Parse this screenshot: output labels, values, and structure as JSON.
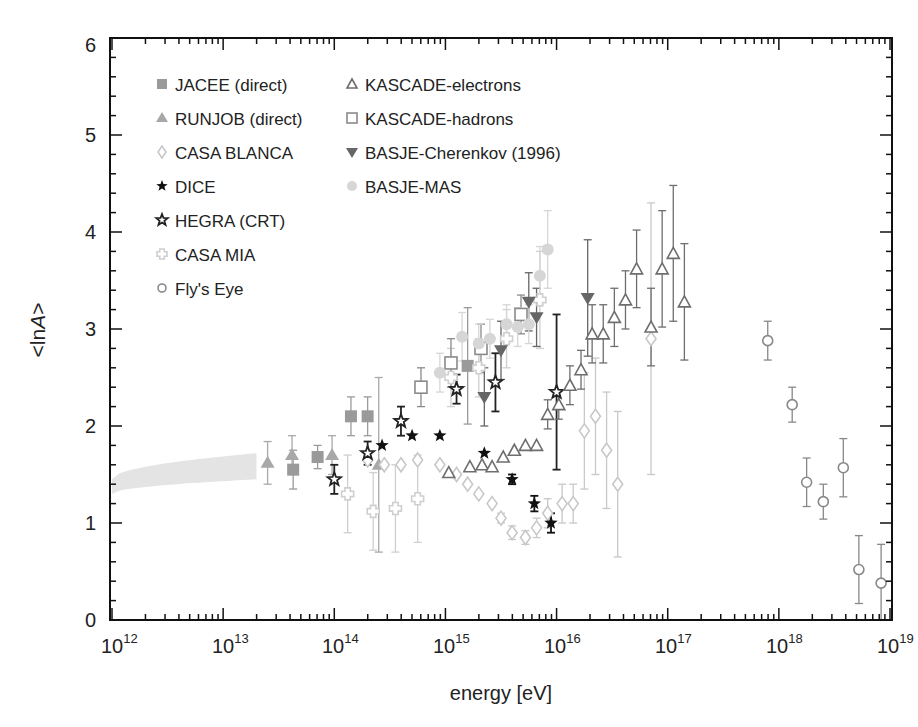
{
  "chart_data": {
    "type": "scatter",
    "title": "",
    "xlabel": "energy [eV]",
    "ylabel": "<lnA>",
    "xscale": "log",
    "xlim": [
      1000000000000.0,
      1e+19
    ],
    "ylim": [
      0,
      6
    ],
    "x_tick_labels": [
      "10^12",
      "10^13",
      "10^14",
      "10^15",
      "10^16",
      "10^17",
      "10^18",
      "10^19"
    ],
    "y_tick_labels": [
      "0",
      "1",
      "2",
      "3",
      "4",
      "5",
      "6"
    ],
    "grid": false,
    "legend_position": "upper-left (two columns, inside)",
    "band": {
      "name": "direct measurements band",
      "x_log_from": 12.0,
      "x_log_to": 13.3,
      "lower": [
        1.3,
        1.45
      ],
      "upper": [
        1.45,
        1.72
      ],
      "color": "#e4e4e4"
    },
    "series": [
      {
        "name": "JACEE (direct)",
        "marker": "square-filled",
        "color": "#9a9a9a",
        "points": [
          [
            13.63,
            1.55,
            0.2
          ],
          [
            13.85,
            1.68,
            0.12
          ],
          [
            14.15,
            2.1,
            0.2
          ],
          [
            14.3,
            2.1,
            0.2
          ],
          [
            15.2,
            2.62,
            0.6
          ]
        ]
      },
      {
        "name": "RUNJOB (direct)",
        "marker": "triangle-filled",
        "color": "#a8a8a8",
        "points": [
          [
            13.4,
            1.62,
            0.22
          ],
          [
            13.62,
            1.7,
            0.2
          ],
          [
            13.98,
            1.7,
            0.2
          ],
          [
            14.4,
            1.6,
            0.9
          ]
        ]
      },
      {
        "name": "CASA BLANCA",
        "marker": "diamond-open",
        "color": "#c8c8c8",
        "points": [
          [
            14.3,
            1.65,
            0
          ],
          [
            14.45,
            1.6,
            0
          ],
          [
            14.6,
            1.6,
            0
          ],
          [
            14.75,
            1.65,
            0
          ],
          [
            14.95,
            1.6,
            0
          ],
          [
            15.1,
            1.5,
            0
          ],
          [
            15.2,
            1.4,
            0
          ],
          [
            15.3,
            1.3,
            0
          ],
          [
            15.42,
            1.2,
            0
          ],
          [
            15.5,
            1.05,
            0.05
          ],
          [
            15.6,
            0.9,
            0.07
          ],
          [
            15.72,
            0.85,
            0.07
          ],
          [
            15.82,
            0.95,
            0.1
          ],
          [
            15.92,
            1.1,
            0.15
          ],
          [
            16.05,
            1.2,
            0.2
          ],
          [
            16.15,
            1.2,
            0.2
          ],
          [
            16.25,
            1.95,
            0.6
          ],
          [
            16.35,
            2.1,
            0.6
          ],
          [
            16.45,
            1.75,
            0.6
          ],
          [
            16.55,
            1.4,
            0.75
          ],
          [
            16.85,
            2.9,
            1.4
          ]
        ]
      },
      {
        "name": "DICE",
        "marker": "star-filled",
        "color": "#111111",
        "points": [
          [
            14.43,
            1.8,
            0
          ],
          [
            14.7,
            1.9,
            0
          ],
          [
            14.95,
            1.9,
            0
          ],
          [
            15.35,
            1.72,
            0
          ],
          [
            15.6,
            1.45,
            0.05
          ],
          [
            15.8,
            1.2,
            0.08
          ],
          [
            15.95,
            1.0,
            0.1
          ]
        ]
      },
      {
        "name": "HEGRA (CRT)",
        "marker": "star-open",
        "color": "#222222",
        "points": [
          [
            14.0,
            1.45,
            0.15
          ],
          [
            14.3,
            1.72,
            0.12
          ],
          [
            14.6,
            2.05,
            0.15
          ],
          [
            15.1,
            2.38,
            0.15
          ],
          [
            15.45,
            2.45,
            0.3
          ],
          [
            16.0,
            2.35,
            0.8
          ]
        ]
      },
      {
        "name": "CASA MIA",
        "marker": "plus-open",
        "color": "#cfcfcf",
        "points": [
          [
            14.12,
            1.3,
            0.4
          ],
          [
            14.35,
            1.12,
            0.4
          ],
          [
            14.55,
            1.15,
            0.45
          ],
          [
            14.75,
            1.25,
            0.45
          ],
          [
            15.05,
            2.5,
            0.3
          ],
          [
            15.3,
            2.6,
            0.3
          ],
          [
            15.55,
            2.9,
            0.3
          ],
          [
            15.85,
            3.3,
            0.5
          ]
        ]
      },
      {
        "name": "Fly's Eye",
        "marker": "circle-open",
        "color": "#888888",
        "points": [
          [
            17.9,
            2.88,
            0.2
          ],
          [
            18.12,
            2.22,
            0.18
          ],
          [
            18.25,
            1.42,
            0.25
          ],
          [
            18.4,
            1.22,
            0.18
          ],
          [
            18.58,
            1.57,
            0.3
          ],
          [
            18.72,
            0.52,
            0.35
          ],
          [
            18.92,
            0.38,
            0.4
          ]
        ]
      },
      {
        "name": "KASCADE-electrons",
        "marker": "triangle-open",
        "color": "#6e6e6e",
        "points": [
          [
            15.03,
            1.52,
            0
          ],
          [
            15.22,
            1.58,
            0
          ],
          [
            15.33,
            1.6,
            0
          ],
          [
            15.42,
            1.58,
            0
          ],
          [
            15.52,
            1.68,
            0
          ],
          [
            15.62,
            1.75,
            0
          ],
          [
            15.72,
            1.8,
            0
          ],
          [
            15.82,
            1.8,
            0
          ],
          [
            15.92,
            2.12,
            0.15
          ],
          [
            16.02,
            2.22,
            0.15
          ],
          [
            16.12,
            2.42,
            0.2
          ],
          [
            16.22,
            2.58,
            0.2
          ],
          [
            16.32,
            2.95,
            0.3
          ],
          [
            16.42,
            2.95,
            0.3
          ],
          [
            16.52,
            3.12,
            0.3
          ],
          [
            16.62,
            3.3,
            0.3
          ],
          [
            16.72,
            3.62,
            0.4
          ],
          [
            16.85,
            3.02,
            0.4
          ],
          [
            16.95,
            3.62,
            0.6
          ],
          [
            17.05,
            3.78,
            0.7
          ],
          [
            17.15,
            3.28,
            0.6
          ]
        ]
      },
      {
        "name": "KASCADE-hadrons",
        "marker": "square-open",
        "color": "#8a8a8a",
        "points": [
          [
            14.78,
            2.4,
            0.2
          ],
          [
            15.05,
            2.65,
            0.25
          ],
          [
            15.32,
            2.8,
            0.25
          ],
          [
            15.68,
            3.15,
            0.2
          ]
        ]
      },
      {
        "name": "BASJE-Cherenkov (1996)",
        "marker": "triangle-down-filled",
        "color": "#666666",
        "points": [
          [
            15.35,
            2.3,
            0.3
          ],
          [
            15.5,
            2.78,
            0.3
          ],
          [
            15.75,
            3.28,
            0.3
          ],
          [
            15.82,
            3.12,
            0.3
          ],
          [
            16.28,
            3.32,
            0.6
          ]
        ]
      },
      {
        "name": "BASJE-MAS",
        "marker": "circle-filled",
        "color": "#d6d6d6",
        "points": [
          [
            14.95,
            2.55,
            0.2
          ],
          [
            15.15,
            2.92,
            0.25
          ],
          [
            15.3,
            2.85,
            0.2
          ],
          [
            15.4,
            2.9,
            0.2
          ],
          [
            15.55,
            3.05,
            0.2
          ],
          [
            15.65,
            3.02,
            0.2
          ],
          [
            15.75,
            3.05,
            0.2
          ],
          [
            15.85,
            3.55,
            0.3
          ],
          [
            15.92,
            3.82,
            0.4
          ]
        ]
      }
    ]
  },
  "axes": {
    "xlabel": "energy [eV]",
    "ylabel_prefix": "<",
    "ylabel_main": "ln",
    "ylabel_italic": "A",
    "ylabel_suffix": ">",
    "y_ticks": [
      "0",
      "1",
      "2",
      "3",
      "4",
      "5",
      "6"
    ],
    "x_ticks": [
      {
        "base": "10",
        "exp": "12"
      },
      {
        "base": "10",
        "exp": "13"
      },
      {
        "base": "10",
        "exp": "14"
      },
      {
        "base": "10",
        "exp": "15"
      },
      {
        "base": "10",
        "exp": "16"
      },
      {
        "base": "10",
        "exp": "17"
      },
      {
        "base": "10",
        "exp": "18"
      },
      {
        "base": "10",
        "exp": "19"
      }
    ]
  },
  "legend": {
    "col1": [
      "JACEE (direct)",
      "RUNJOB (direct)",
      "CASA BLANCA",
      "DICE",
      "HEGRA (CRT)",
      "CASA MIA",
      "Fly's Eye"
    ],
    "col2": [
      "KASCADE-electrons",
      "KASCADE-hadrons",
      "BASJE-Cherenkov (1996)",
      "BASJE-MAS"
    ]
  }
}
